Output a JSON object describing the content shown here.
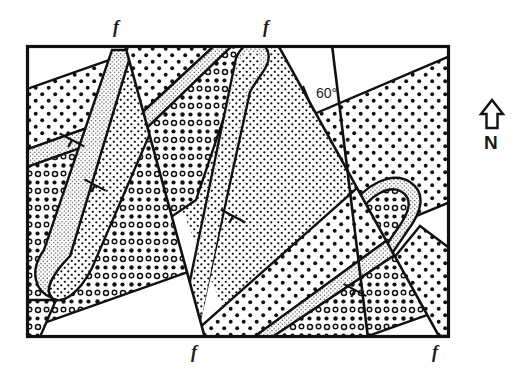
{
  "figure": {
    "type": "geologic-map",
    "frame": {
      "x": 26,
      "y": 45,
      "width": 424,
      "height": 293,
      "border_color": "#111111",
      "border_width": 3
    }
  },
  "annotations": {
    "fault_labels": [
      {
        "id": "fault-label-top-left",
        "text": "f",
        "x": 118,
        "y": 20
      },
      {
        "id": "fault-label-top-right",
        "text": "f",
        "x": 268,
        "y": 20
      },
      {
        "id": "fault-label-bottom-left",
        "text": "f",
        "x": 196,
        "y": 345
      },
      {
        "id": "fault-label-bottom-right",
        "text": "f",
        "x": 437,
        "y": 345
      }
    ],
    "dip": {
      "id": "dip-annotation",
      "text": "60°",
      "x": 318,
      "y": 92,
      "tick_x1": 303,
      "tick_y1": 88,
      "tick_x2": 311,
      "tick_y2": 108
    },
    "north_arrow": {
      "id": "north-arrow",
      "label": "N",
      "x": 492,
      "y": 115,
      "label_y": 146
    }
  },
  "faults": [
    {
      "id": "fault-west",
      "x1": 125,
      "y1": 45,
      "x2": 205,
      "y2": 338,
      "label": "f"
    },
    {
      "id": "fault-east",
      "x1": 278,
      "y1": 45,
      "x2": 440,
      "y2": 338,
      "label": "f"
    },
    {
      "id": "fault-cross",
      "x1": 330,
      "y1": 45,
      "x2": 368,
      "y2": 338,
      "label": "f"
    }
  ],
  "lithology": {
    "units": [
      {
        "id": "unit-coarse-dot",
        "name": "coarse dot stipple",
        "pattern": "coarse-dots",
        "color": "#111111"
      },
      {
        "id": "unit-fine-dot",
        "name": "fine dot stipple",
        "pattern": "fine-dots",
        "color": "#111111"
      },
      {
        "id": "unit-circle",
        "name": "open circle stipple",
        "pattern": "open-circles",
        "color": "#111111"
      },
      {
        "id": "unit-blank",
        "name": "unpatterned unit",
        "pattern": "none",
        "color": "#ffffff"
      }
    ]
  },
  "strike_dip_symbols": [
    {
      "id": "strike-dip-1",
      "x": 72,
      "y": 140,
      "angle": 28
    },
    {
      "id": "strike-dip-2",
      "x": 95,
      "y": 185,
      "angle": 28
    },
    {
      "id": "strike-dip-3",
      "x": 233,
      "y": 216,
      "angle": 28
    },
    {
      "id": "strike-dip-4",
      "x": 355,
      "y": 290,
      "angle": 28
    }
  ]
}
